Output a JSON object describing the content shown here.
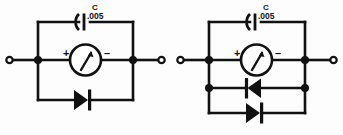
{
  "figure": {
    "background_color": "#fdfdfd",
    "ink_color": "#111111",
    "circuits": [
      {
        "id": "left",
        "name": "single-diode-meter-protection",
        "capacitor": {
          "designator": "C",
          "value": ".005",
          "symbol": "capacitor-curved-plate"
        },
        "meter": {
          "symbol": "panel-meter",
          "plus_label": "+",
          "minus_label": "–",
          "needle_direction": "up-right"
        },
        "diodes": [
          {
            "id": "left-diode-1",
            "orientation": "cathode-right",
            "symbol": "diode"
          }
        ],
        "terminals": [
          {
            "id": "left-terminal-in",
            "side": "left",
            "style": "open-circle"
          },
          {
            "id": "left-terminal-out",
            "side": "right",
            "style": "open-circle"
          }
        ],
        "junctions": 2
      },
      {
        "id": "right",
        "name": "dual-antiparallel-diode-meter-protection",
        "capacitor": {
          "designator": "C",
          "value": ".005",
          "symbol": "capacitor-curved-plate"
        },
        "meter": {
          "symbol": "panel-meter",
          "plus_label": "+",
          "minus_label": "–",
          "needle_direction": "up-right"
        },
        "diodes": [
          {
            "id": "right-diode-1",
            "orientation": "cathode-left",
            "symbol": "diode"
          },
          {
            "id": "right-diode-2",
            "orientation": "cathode-right",
            "symbol": "diode"
          }
        ],
        "terminals": [
          {
            "id": "right-terminal-in",
            "side": "left",
            "style": "open-circle"
          },
          {
            "id": "right-terminal-out",
            "side": "right",
            "style": "open-circle"
          }
        ],
        "junctions": 4
      }
    ]
  }
}
